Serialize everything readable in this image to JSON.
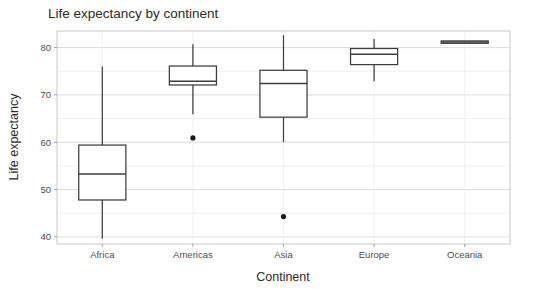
{
  "chart_data": {
    "type": "box",
    "title": "Life expectancy by continent",
    "xlabel": "Continent",
    "ylabel": "Life expectancy",
    "categories": [
      "Africa",
      "Americas",
      "Asia",
      "Europe",
      "Oceania"
    ],
    "ylim": [
      38.5,
      83.5
    ],
    "y_major_ticks": [
      40,
      50,
      60,
      70,
      80
    ],
    "y_major_tick_labels": [
      "40",
      "50",
      "60",
      "70",
      "80"
    ],
    "y_minor_ticks": [
      45,
      55,
      65,
      75,
      85
    ],
    "grid": true,
    "legend": "none",
    "boxes": [
      {
        "category": "Africa",
        "whisker_low": 39.6,
        "q1": 47.8,
        "median": 53.3,
        "q3": 59.4,
        "whisker_high": 76.0,
        "outliers": []
      },
      {
        "category": "Americas",
        "whisker_low": 65.9,
        "q1": 72.1,
        "median": 72.9,
        "q3": 76.1,
        "whisker_high": 80.7,
        "outliers": [
          60.9
        ]
      },
      {
        "category": "Asia",
        "whisker_low": 60.0,
        "q1": 65.3,
        "median": 72.4,
        "q3": 75.2,
        "whisker_high": 82.6,
        "outliers": [
          44.3
        ]
      },
      {
        "category": "Europe",
        "whisker_low": 72.9,
        "q1": 76.4,
        "median": 78.6,
        "q3": 79.8,
        "whisker_high": 81.8,
        "outliers": []
      },
      {
        "category": "Oceania",
        "whisker_low": 80.9,
        "q1": 80.9,
        "median": 81.2,
        "q3": 81.4,
        "whisker_high": 81.4,
        "outliers": []
      }
    ],
    "colors": {
      "box_stroke": "#3d3d3d",
      "box_fill": "#ffffff",
      "grid_major": "#d9d9d9",
      "grid_minor": "#ececec",
      "panel_border": "#c8c8c8",
      "text": "#2b2b2b",
      "outlier": "#1a1a1a",
      "background": "#ffffff"
    }
  }
}
